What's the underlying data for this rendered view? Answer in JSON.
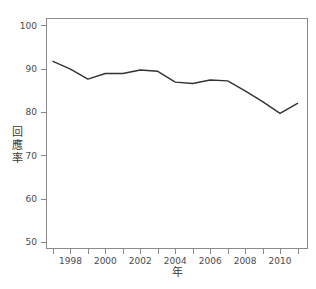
{
  "chart_data": {
    "type": "line",
    "title": "",
    "subtitle": "",
    "xlabel": "年",
    "ylabel": "回應率",
    "xlim": [
      1996.6,
      2011.6
    ],
    "ylim": [
      48.5,
      101.8
    ],
    "grid": false,
    "legend": null,
    "legend_position": "none",
    "line_color": "#333333",
    "axis_color": "#8a8a8a",
    "background_color": "#ffffff",
    "x_tick_labels": [
      "1998",
      "2000",
      "2002",
      "2004",
      "2006",
      "2008",
      "2010"
    ],
    "x_tick_values": [
      1998,
      2000,
      2002,
      2004,
      2006,
      2008,
      2010
    ],
    "x_minor_tick_values": [
      1997,
      1999,
      2001,
      2003,
      2005,
      2007,
      2009,
      2011
    ],
    "y_tick_labels": [
      "50",
      "60",
      "70",
      "80",
      "90",
      "100"
    ],
    "y_tick_values": [
      50,
      60,
      70,
      80,
      90,
      100
    ],
    "x": [
      1997,
      1998,
      1999,
      2000,
      2001,
      2002,
      2003,
      2004,
      2005,
      2006,
      2007,
      2008,
      2009,
      2010,
      2011
    ],
    "values": [
      91.8,
      90.0,
      87.7,
      89.0,
      89.0,
      89.8,
      89.5,
      87.0,
      86.7,
      87.5,
      87.3,
      85.0,
      82.5,
      79.8,
      82.1
    ],
    "series": [
      {
        "name": "回應率",
        "values": [
          91.8,
          90.0,
          87.7,
          89.0,
          89.0,
          89.8,
          89.5,
          87.0,
          86.7,
          87.5,
          87.3,
          85.0,
          82.5,
          79.8,
          82.1
        ]
      }
    ],
    "annotations": []
  },
  "axes": {
    "ylabel_chars": [
      "回",
      "應",
      "率"
    ],
    "xlabel_text": "年"
  }
}
